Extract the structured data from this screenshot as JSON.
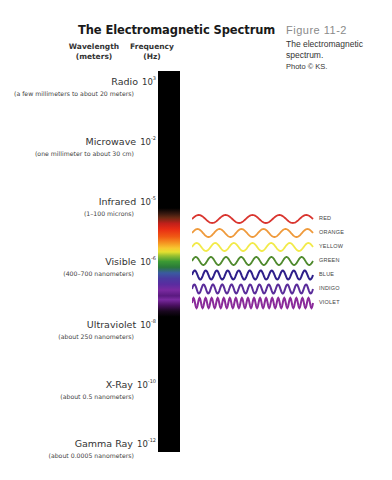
{
  "header": {
    "title": "The Electromagnetic Spectrum",
    "wavelength_col": "Wavelength",
    "wavelength_unit": "(meters)",
    "frequency_col": "Frequency",
    "frequency_unit": "(Hz)"
  },
  "figure": {
    "number": "Figure 11-2",
    "caption": "The electromagnetic spectrum.",
    "credit": "Photo © KS."
  },
  "bands": [
    {
      "name": "Radio",
      "exp_base": "10",
      "exponent": "3",
      "range": "(a few millimeters to about 20 meters)"
    },
    {
      "name": "Microwave",
      "exp_base": "10",
      "exponent": "-2",
      "range": "(one millimeter to about 30 cm)"
    },
    {
      "name": "Infrared",
      "exp_base": "10",
      "exponent": "-5",
      "range": "(1–100 microns)"
    },
    {
      "name": "Visible",
      "exp_base": "10",
      "exponent": "-6",
      "range": "(400–700 nanometers)"
    },
    {
      "name": "Ultraviolet",
      "exp_base": "10",
      "exponent": "-8",
      "range": "(about 250 nanometers)"
    },
    {
      "name": "X-Ray",
      "exp_base": "10",
      "exponent": "-10",
      "range": "(about 0.5 nanometers)"
    },
    {
      "name": "Gamma Ray",
      "exp_base": "10",
      "exponent": "-12",
      "range": "(about 0.0005 nanometers)"
    }
  ],
  "visible_waves": [
    {
      "label": "RED",
      "color": "#d9352f",
      "cycles": 4.5
    },
    {
      "label": "ORANGE",
      "color": "#ef9a3c",
      "cycles": 5.5
    },
    {
      "label": "YELLOW",
      "color": "#f2ea4a",
      "cycles": 6.5
    },
    {
      "label": "GREEN",
      "color": "#4f8a2e",
      "cycles": 8
    },
    {
      "label": "BLUE",
      "color": "#2e1f8a",
      "cycles": 11
    },
    {
      "label": "INDIGO",
      "color": "#5a2c9a",
      "cycles": 13
    },
    {
      "label": "VIOLET",
      "color": "#8a2a9a",
      "cycles": 20
    }
  ]
}
